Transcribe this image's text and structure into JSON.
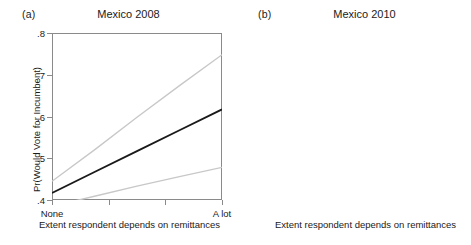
{
  "figure": {
    "x_axis_title": "Extent respondent depends on remittances",
    "y_axis_title": "Pr(Would Vote for Incumbent)",
    "x_tick_left": "None",
    "x_tick_right": "A lot",
    "line_color_fit": "#1a1a1a",
    "line_color_ci": "#c8c8c8",
    "frame_color": "#8a8a8a"
  },
  "panels": [
    {
      "tag": "(a)",
      "title": "Mexico 2008",
      "y_ticks": [
        ".4",
        ".5",
        ".6",
        ".7",
        ".8"
      ]
    },
    {
      "tag": "(b)",
      "title": "Mexico 2010",
      "y_ticks": [
        ".2",
        ".3",
        ".4",
        ".5",
        ".6"
      ]
    }
  ],
  "chart_data": [
    {
      "type": "line",
      "title": "Mexico 2008",
      "panel_tag": "(a)",
      "xlabel": "Extent respondent depends on remittances",
      "ylabel": "Pr(Would Vote for Incumbent)",
      "xlim": [
        0,
        1
      ],
      "ylim": [
        0.4,
        0.8
      ],
      "yticks": [
        0.4,
        0.5,
        0.6,
        0.7,
        0.8
      ],
      "ytick_labels": [
        ".4",
        ".5",
        ".6",
        ".7",
        ".8"
      ],
      "xticks": [
        0,
        0.3333,
        0.6667,
        1
      ],
      "xtick_labels": [
        "None",
        "",
        "",
        "A lot"
      ],
      "grid": false,
      "legend": "none",
      "series": [
        {
          "name": "Upper 95% CI",
          "style": "light-gray",
          "x": [
            0,
            0.25,
            0.5,
            0.75,
            1
          ],
          "values": [
            0.445,
            0.52,
            0.598,
            0.674,
            0.748
          ]
        },
        {
          "name": "Predicted probability",
          "style": "solid-dark",
          "x": [
            0,
            0.25,
            0.5,
            0.75,
            1
          ],
          "values": [
            0.417,
            0.467,
            0.517,
            0.567,
            0.617
          ]
        },
        {
          "name": "Lower 95% CI",
          "style": "light-gray",
          "x": [
            0,
            0.25,
            0.5,
            0.75,
            1
          ],
          "values": [
            0.385,
            0.409,
            0.433,
            0.456,
            0.478
          ]
        }
      ]
    },
    {
      "type": "line",
      "title": "Mexico 2010",
      "panel_tag": "(b)",
      "xlabel": "Extent respondent depends on remittances",
      "ylabel": "Pr(Would Vote for Incumbent)",
      "xlim": [
        0,
        1
      ],
      "ylim": [
        0.2,
        0.6
      ],
      "yticks": [
        0.2,
        0.3,
        0.4,
        0.5,
        0.6
      ],
      "ytick_labels": [
        ".2",
        ".3",
        ".4",
        ".5",
        ".6"
      ],
      "xticks": [
        0,
        0.3333,
        0.6667,
        1
      ],
      "xtick_labels": [
        "None",
        "",
        "",
        "A lot"
      ],
      "grid": false,
      "legend": "none",
      "series": [
        {
          "name": "Upper 95% CI",
          "style": "light-gray",
          "x": [
            0,
            0.25,
            0.5,
            0.75,
            1
          ],
          "values": [
            0.292,
            0.357,
            0.432,
            0.518,
            0.605
          ]
        },
        {
          "name": "Predicted probability",
          "style": "solid-dark",
          "x": [
            0,
            0.25,
            0.5,
            0.75,
            1
          ],
          "values": [
            0.268,
            0.312,
            0.357,
            0.402,
            0.447
          ]
        },
        {
          "name": "Lower 95% CI",
          "style": "light-gray",
          "x": [
            0,
            0.25,
            0.5,
            0.75,
            1
          ],
          "values": [
            0.242,
            0.268,
            0.283,
            0.291,
            0.297
          ]
        }
      ]
    }
  ]
}
